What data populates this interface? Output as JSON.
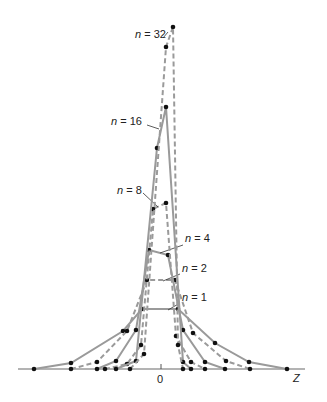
{
  "chart_data": {
    "type": "line",
    "title": "",
    "xlabel": "Z",
    "ylabel": "",
    "x_ticks": [
      {
        "label": "0",
        "px": 161
      }
    ],
    "grid": false,
    "legend": "inline annotations",
    "axis": {
      "baseline_y": 369,
      "x_start": 18,
      "x_end": 305
    },
    "colors": {
      "line": "#9a9a9a",
      "marker": "#111111",
      "text": "#222222"
    },
    "series": [
      {
        "name": "n = 1",
        "style": "solid",
        "label_pos": [
          182,
          301
        ],
        "leader": [
          [
            180,
            303
          ],
          [
            168,
            310
          ]
        ],
        "points": [
          [
            34,
            369
          ],
          [
            71,
            363
          ],
          [
            123,
            331
          ],
          [
            142,
            309
          ],
          [
            178,
            309
          ],
          [
            215,
            343
          ],
          [
            249,
            362
          ],
          [
            287,
            369
          ]
        ]
      },
      {
        "name": "n = 2",
        "style": "dashed",
        "label_pos": [
          182,
          272
        ],
        "leader": [
          [
            180,
            274
          ],
          [
            163,
            281
          ]
        ],
        "points": [
          [
            71,
            369
          ],
          [
            97,
            362
          ],
          [
            127,
            331
          ],
          [
            147,
            280
          ],
          [
            175,
            280
          ],
          [
            193,
            333
          ],
          [
            226,
            361
          ],
          [
            250,
            369
          ]
        ]
      },
      {
        "name": "n = 4",
        "style": "solid",
        "label_pos": [
          185,
          242
        ],
        "leader": [
          [
            183,
            245
          ],
          [
            160,
            253
          ]
        ],
        "points": [
          [
            97,
            369
          ],
          [
            116,
            361
          ],
          [
            136,
            330
          ],
          [
            149,
            250
          ],
          [
            168,
            255
          ],
          [
            183,
            330
          ],
          [
            205,
            362
          ],
          [
            225,
            369
          ]
        ]
      },
      {
        "name": "n = 8",
        "style": "dashed",
        "label_pos": [
          117,
          194
        ],
        "leader": [
          [
            143,
            193
          ],
          [
            158,
            207
          ]
        ],
        "points": [
          [
            105,
            369
          ],
          [
            127,
            364
          ],
          [
            141,
            345
          ],
          [
            153,
            209
          ],
          [
            166,
            203
          ],
          [
            176,
            336
          ],
          [
            191,
            362
          ],
          [
            205,
            369
          ]
        ]
      },
      {
        "name": "n = 16",
        "style": "solid",
        "label_pos": [
          111,
          125
        ],
        "leader": [
          [
            147,
            125
          ],
          [
            159,
            129
          ]
        ],
        "points": [
          [
            116,
            369
          ],
          [
            136,
            361
          ],
          [
            157,
            148
          ],
          [
            166,
            107
          ],
          [
            183,
            362
          ],
          [
            191,
            369
          ]
        ]
      },
      {
        "name": "n = 32",
        "style": "dashed",
        "label_pos": [
          135,
          38
        ],
        "leader": [
          [
            163,
            38
          ],
          [
            168,
            32
          ]
        ],
        "points": [
          [
            130,
            369
          ],
          [
            144,
            354
          ],
          [
            166,
            47
          ],
          [
            173,
            27
          ],
          [
            178,
            345
          ],
          [
            183,
            369
          ]
        ]
      }
    ]
  }
}
